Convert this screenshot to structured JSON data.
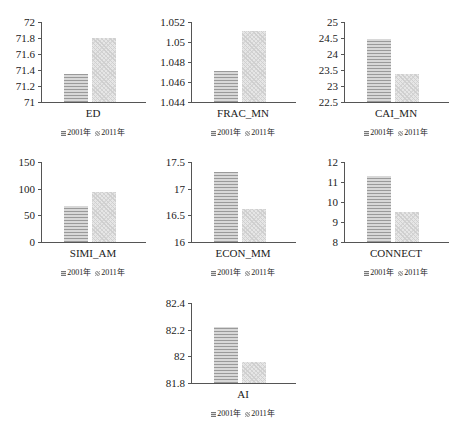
{
  "legend": {
    "s2001": "2001年",
    "s2011": "2011年"
  },
  "chart_data": [
    {
      "type": "bar",
      "title": "",
      "xlabel": "ED",
      "categories": [
        "ED"
      ],
      "series": [
        {
          "name": "2001年",
          "values": [
            71.35
          ]
        },
        {
          "name": "2011年",
          "values": [
            71.8
          ]
        }
      ],
      "ylim": [
        71,
        72
      ],
      "yticks": [
        "71",
        "71.2",
        "71.4",
        "71.6",
        "71.8",
        "72"
      ],
      "grid": false,
      "legend_position": "bottom"
    },
    {
      "type": "bar",
      "title": "",
      "xlabel": "FRAC_MN",
      "categories": [
        "FRAC_MN"
      ],
      "series": [
        {
          "name": "2001年",
          "values": [
            1.0471
          ]
        },
        {
          "name": "2011年",
          "values": [
            1.0511
          ]
        }
      ],
      "ylim": [
        1.044,
        1.052
      ],
      "yticks": [
        "1.044",
        "1.046",
        "1.048",
        "1.05",
        "1.052"
      ],
      "grid": false,
      "legend_position": "bottom"
    },
    {
      "type": "bar",
      "title": "",
      "xlabel": "CAI_MN",
      "categories": [
        "CAI_MN"
      ],
      "series": [
        {
          "name": "2001年",
          "values": [
            24.48
          ]
        },
        {
          "name": "2011年",
          "values": [
            23.38
          ]
        }
      ],
      "ylim": [
        22.5,
        25
      ],
      "yticks": [
        "22.5",
        "23",
        "23.5",
        "24",
        "24.5",
        "25"
      ],
      "grid": false,
      "legend_position": "bottom"
    },
    {
      "type": "bar",
      "title": "",
      "xlabel": "SIMI_AM",
      "categories": [
        "SIMI_AM"
      ],
      "series": [
        {
          "name": "2001年",
          "values": [
            67
          ]
        },
        {
          "name": "2011年",
          "values": [
            93
          ]
        }
      ],
      "ylim": [
        0,
        150
      ],
      "yticks": [
        "0",
        "50",
        "100",
        "150"
      ],
      "grid": false,
      "legend_position": "bottom"
    },
    {
      "type": "bar",
      "title": "",
      "xlabel": "ECON_MM",
      "categories": [
        "ECON_MM"
      ],
      "series": [
        {
          "name": "2001年",
          "values": [
            17.32
          ]
        },
        {
          "name": "2011年",
          "values": [
            16.62
          ]
        }
      ],
      "ylim": [
        16,
        17.5
      ],
      "yticks": [
        "16",
        "16.5",
        "17",
        "17.5"
      ],
      "grid": false,
      "legend_position": "bottom"
    },
    {
      "type": "bar",
      "title": "",
      "xlabel": "CONNECT",
      "categories": [
        "CONNECT"
      ],
      "series": [
        {
          "name": "2001年",
          "values": [
            11.28
          ]
        },
        {
          "name": "2011年",
          "values": [
            9.48
          ]
        }
      ],
      "ylim": [
        8,
        12
      ],
      "yticks": [
        "8",
        "9",
        "10",
        "11",
        "12"
      ],
      "grid": false,
      "legend_position": "bottom"
    },
    {
      "type": "bar",
      "title": "",
      "xlabel": "AI",
      "categories": [
        "AI"
      ],
      "series": [
        {
          "name": "2001年",
          "values": [
            82.22
          ]
        },
        {
          "name": "2011年",
          "values": [
            81.96
          ]
        }
      ],
      "ylim": [
        81.8,
        82.4
      ],
      "yticks": [
        "81.8",
        "82",
        "82.2",
        "82.4"
      ],
      "grid": false,
      "legend_position": "bottom"
    }
  ],
  "layout": [
    {
      "left": 0,
      "top": 0
    },
    {
      "left": 150,
      "top": 0
    },
    {
      "left": 303,
      "top": 0
    },
    {
      "left": 0,
      "top": 140
    },
    {
      "left": 150,
      "top": 140
    },
    {
      "left": 303,
      "top": 140
    },
    {
      "left": 150,
      "top": 281
    }
  ]
}
